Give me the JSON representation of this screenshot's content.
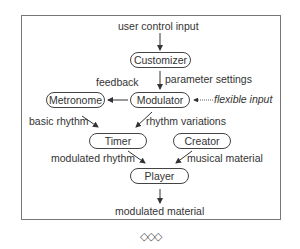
{
  "diagram": {
    "nodes": {
      "customizer": "Customizer",
      "modulator": "Modulator",
      "metronome": "Metronome",
      "timer": "Timer",
      "creator": "Creator",
      "player": "Player"
    },
    "labels": {
      "user_control_input": "user control input",
      "parameter_settings": "parameter settings",
      "feedback": "feedback",
      "flexible_input": "flexible input",
      "basic_rhythm": "basic rhythm",
      "rhythm_variations": "rhythm variations",
      "modulated_rhythm": "modulated rhythm",
      "musical_material": "musical material",
      "modulated_material": "modulated material"
    },
    "edges": [
      {
        "from": "user control input",
        "to": "Customizer"
      },
      {
        "from": "Customizer",
        "to": "Modulator",
        "label": "parameter settings"
      },
      {
        "from": "Modulator",
        "to": "Metronome",
        "label": "feedback"
      },
      {
        "from": "flexible input",
        "to": "Modulator",
        "style": "dotted"
      },
      {
        "from": "Metronome",
        "to": "Timer",
        "label": "basic rhythm"
      },
      {
        "from": "Modulator",
        "to": "Timer",
        "label": "rhythm variations"
      },
      {
        "from": "Timer",
        "to": "Player",
        "label": "modulated rhythm"
      },
      {
        "from": "Creator",
        "to": "Player",
        "label": "musical material"
      },
      {
        "from": "Player",
        "to": "modulated material"
      }
    ],
    "separator": "◇◇◇"
  }
}
